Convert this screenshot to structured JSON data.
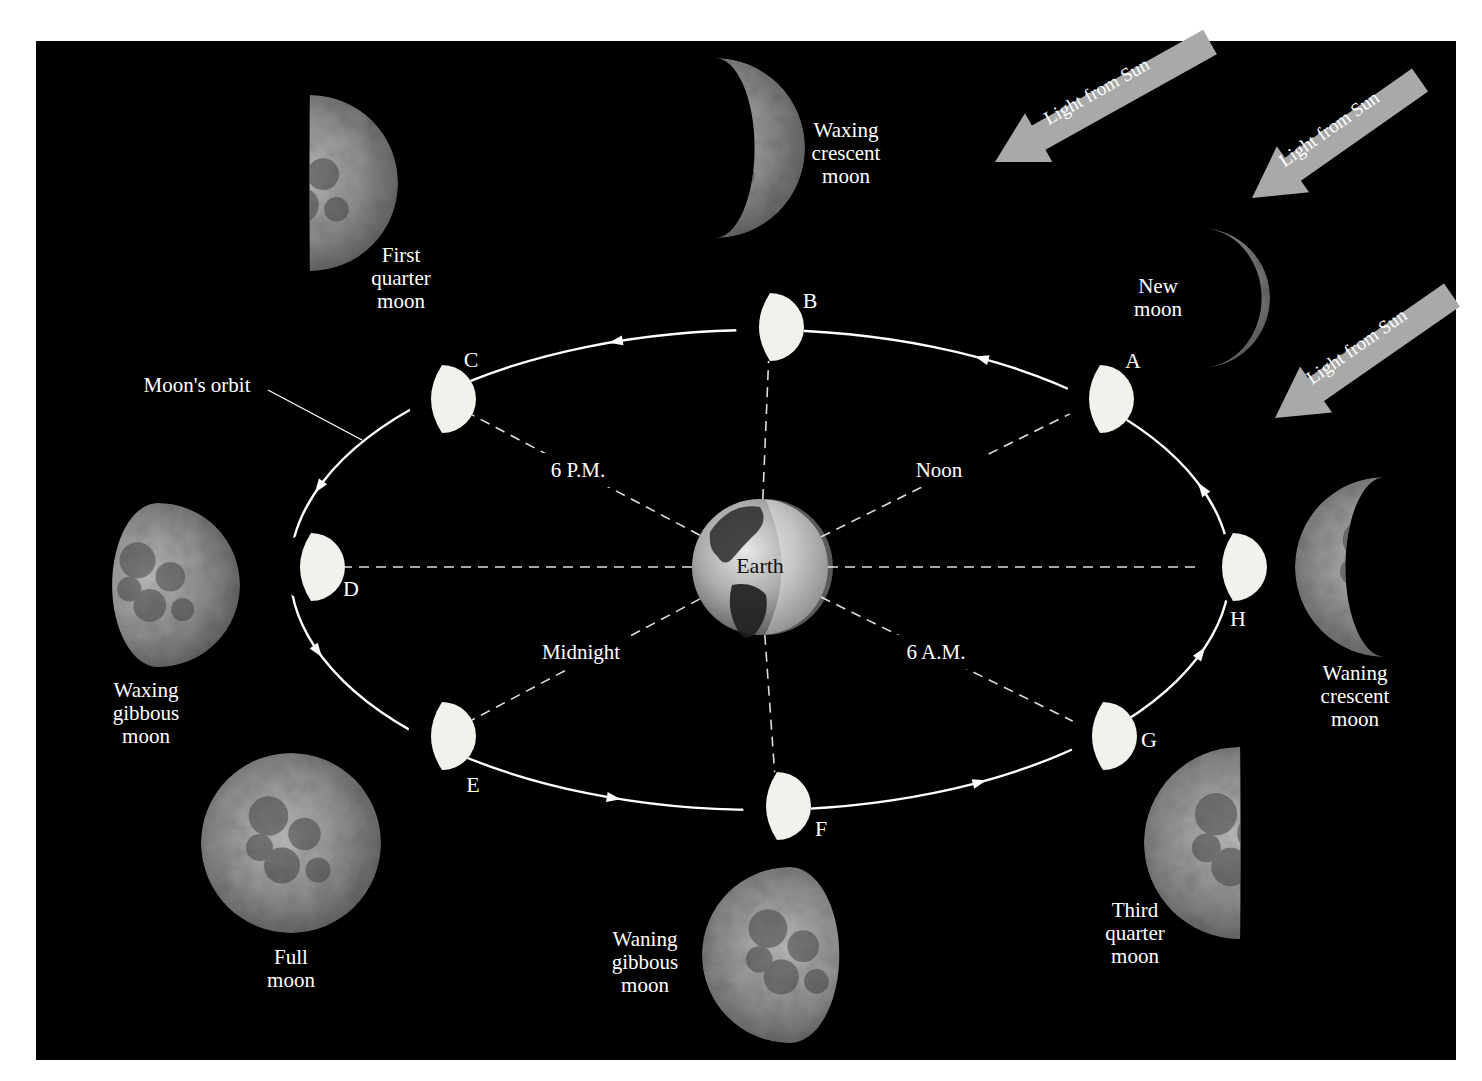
{
  "figure": {
    "background": "#000000",
    "page_color": "#ffffff",
    "orbit_color": "#ffffff",
    "sunlit_color": "#f2f2ec",
    "dash_color": "#dddddd",
    "arrow_color": "#a9a9a9"
  },
  "sun_arrows": [
    {
      "label": "Light from Sun",
      "tail": [
        1210,
        42
      ],
      "head": [
        995,
        162
      ]
    },
    {
      "label": "Light from Sun",
      "tail": [
        1420,
        80
      ],
      "head": [
        1252,
        198
      ]
    },
    {
      "label": "Light from Sun",
      "tail": [
        1452,
        295
      ],
      "head": [
        1275,
        418
      ]
    }
  ],
  "orbit": {
    "label": "Moon's orbit",
    "label_pos": [
      197,
      392
    ],
    "leader": [
      [
        268,
        390
      ],
      [
        362,
        440
      ]
    ],
    "cx": 760,
    "cy": 570,
    "rx": 470,
    "ry": 240
  },
  "earth": {
    "label": "Earth",
    "cx": 760,
    "cy": 567,
    "r": 68
  },
  "time_labels": [
    {
      "id": "six-pm",
      "text": "6 P.M.",
      "x": 578,
      "y": 477
    },
    {
      "id": "noon",
      "text": "Noon",
      "x": 939,
      "y": 477
    },
    {
      "id": "midnight",
      "text": "Midnight",
      "x": 581,
      "y": 659
    },
    {
      "id": "six-am",
      "text": "6 A.M.",
      "x": 936,
      "y": 659
    }
  ],
  "orbit_positions": [
    {
      "letter": "A",
      "x": 1100,
      "y": 399,
      "label_x": 1133,
      "label_y": 368
    },
    {
      "letter": "B",
      "x": 770,
      "y": 327,
      "label_x": 810,
      "label_y": 308
    },
    {
      "letter": "C",
      "x": 442,
      "y": 399,
      "label_x": 471,
      "label_y": 367
    },
    {
      "letter": "D",
      "x": 311,
      "y": 567,
      "label_x": 351,
      "label_y": 596
    },
    {
      "letter": "E",
      "x": 442,
      "y": 736,
      "label_x": 473,
      "label_y": 792
    },
    {
      "letter": "F",
      "x": 777,
      "y": 806,
      "label_x": 821,
      "label_y": 836
    },
    {
      "letter": "G",
      "x": 1103,
      "y": 736,
      "label_x": 1149,
      "label_y": 747
    },
    {
      "letter": "H",
      "x": 1233,
      "y": 567,
      "label_x": 1238,
      "label_y": 626
    }
  ],
  "phases": [
    {
      "id": "new",
      "name_lines": [
        "New",
        "moon"
      ],
      "label_x": 1158,
      "label_y": 293,
      "moon": {
        "cx": 1200,
        "cy": 298,
        "r": 70,
        "lit": 0.06,
        "side": "right"
      }
    },
    {
      "id": "waxing-crescent",
      "name_lines": [
        "Waxing",
        "crescent",
        "moon"
      ],
      "label_x": 846,
      "label_y": 137,
      "moon": {
        "cx": 715,
        "cy": 148,
        "r": 90,
        "lit": 0.28,
        "side": "right"
      }
    },
    {
      "id": "first-quarter",
      "name_lines": [
        "First",
        "quarter",
        "moon"
      ],
      "label_x": 401,
      "label_y": 262,
      "moon": {
        "cx": 310,
        "cy": 183,
        "r": 88,
        "lit": 0.5,
        "side": "right"
      }
    },
    {
      "id": "waxing-gibbous",
      "name_lines": [
        "Waxing",
        "gibbous",
        "moon"
      ],
      "label_x": 146,
      "label_y": 697,
      "moon": {
        "cx": 158,
        "cy": 585,
        "r": 82,
        "lit": 0.78,
        "side": "right"
      }
    },
    {
      "id": "full",
      "name_lines": [
        "Full",
        "moon"
      ],
      "label_x": 291,
      "label_y": 964,
      "moon": {
        "cx": 291,
        "cy": 843,
        "r": 90,
        "lit": 1.0,
        "side": "right"
      }
    },
    {
      "id": "waning-gibbous",
      "name_lines": [
        "Waning",
        "gibbous",
        "moon"
      ],
      "label_x": 645,
      "label_y": 946,
      "moon": {
        "cx": 790,
        "cy": 955,
        "r": 88,
        "lit": 0.78,
        "side": "left"
      }
    },
    {
      "id": "third-quarter",
      "name_lines": [
        "Third",
        "quarter",
        "moon"
      ],
      "label_x": 1135,
      "label_y": 917,
      "moon": {
        "cx": 1240,
        "cy": 843,
        "r": 96,
        "lit": 0.5,
        "side": "left"
      }
    },
    {
      "id": "waning-crescent",
      "name_lines": [
        "Waning",
        "crescent",
        "moon"
      ],
      "label_x": 1355,
      "label_y": 680,
      "moon": {
        "cx": 1385,
        "cy": 567,
        "r": 90,
        "lit": 0.28,
        "side": "left"
      }
    }
  ]
}
